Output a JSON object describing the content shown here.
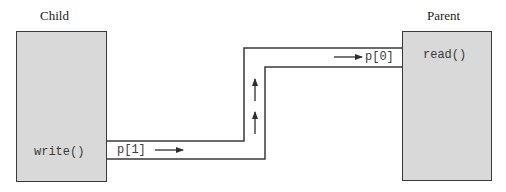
{
  "diagram": {
    "type": "pipe-communication",
    "child": {
      "title": "Child",
      "call_label": "write()",
      "fill": "#d9d9d9"
    },
    "parent": {
      "title": "Parent",
      "call_label": "read()",
      "fill": "#d9d9d9"
    },
    "pipe": {
      "write_end_label": "p[1]",
      "read_end_label": "p[0]",
      "direction": "child-to-parent",
      "flow_arrows": [
        "right",
        "up",
        "up",
        "right"
      ],
      "line_color": "#3a3a3a"
    }
  }
}
